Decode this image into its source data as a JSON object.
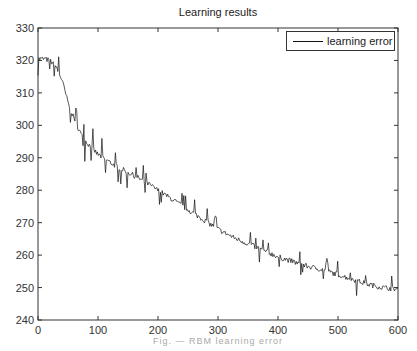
{
  "chart_data": {
    "type": "line",
    "title": "Learning results",
    "xlabel": "",
    "ylabel": "",
    "caption": "Fig. — RBM learning error",
    "xlim": [
      0,
      600
    ],
    "ylim": [
      240,
      330
    ],
    "x_ticks": [
      0,
      100,
      200,
      300,
      400,
      500,
      600
    ],
    "y_ticks": [
      240,
      250,
      260,
      270,
      280,
      290,
      300,
      310,
      320,
      330
    ],
    "grid": false,
    "legend_position": "upper right",
    "series": [
      {
        "name": "learning error",
        "color": "#111111",
        "x": [
          0,
          10,
          20,
          30,
          40,
          50,
          60,
          75,
          100,
          125,
          150,
          175,
          200,
          225,
          250,
          275,
          300,
          325,
          350,
          375,
          400,
          425,
          450,
          475,
          500,
          525,
          550,
          575,
          600
        ],
        "values": [
          320.5,
          320.5,
          320,
          318,
          314,
          307,
          302,
          296,
          291,
          288,
          285.5,
          283,
          280,
          277,
          274,
          271,
          268,
          265.5,
          263.5,
          261.5,
          259.5,
          258,
          256.5,
          255.5,
          254,
          252.5,
          251,
          250,
          249.5
        ]
      }
    ]
  }
}
